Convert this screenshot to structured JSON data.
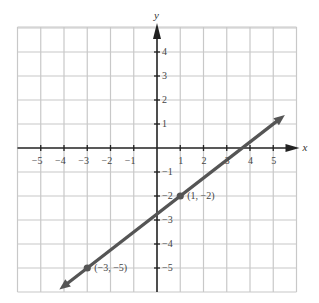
{
  "chart_data": {
    "type": "line",
    "title": "",
    "xlabel": "x",
    "ylabel": "y",
    "xlim": [
      -6,
      6
    ],
    "ylim": [
      -6,
      5
    ],
    "grid": true,
    "x_ticks": [
      -5,
      -4,
      -3,
      -2,
      -1,
      1,
      2,
      3,
      4,
      5
    ],
    "y_ticks": [
      4,
      3,
      2,
      1,
      -1,
      -2,
      -3,
      -4,
      -5
    ],
    "x_tick_labels": [
      "−5",
      "−4",
      "−3",
      "−2",
      "−1",
      "1",
      "2",
      "3",
      "4",
      "5"
    ],
    "y_tick_labels": [
      "4",
      "3",
      "2",
      "1",
      "−1",
      "−2",
      "−3",
      "−4",
      "−5"
    ],
    "series": [
      {
        "name": "line through (1, -2) and (-3, -5)",
        "equation": "y = 0.75x - 2.75",
        "slope": 0.75,
        "intercept": -2.75,
        "x": [
          -4.2,
          5.5
        ],
        "y": [
          -5.9,
          1.375
        ],
        "arrows": "both"
      }
    ],
    "points": [
      {
        "x": 1,
        "y": -2,
        "label": "(1, −2)"
      },
      {
        "x": -3,
        "y": -5,
        "label": "(−3, −5)"
      }
    ]
  },
  "colors": {
    "grid": "#c8c8c8",
    "axis": "#222222",
    "line": "#555555",
    "text": "#444444"
  }
}
